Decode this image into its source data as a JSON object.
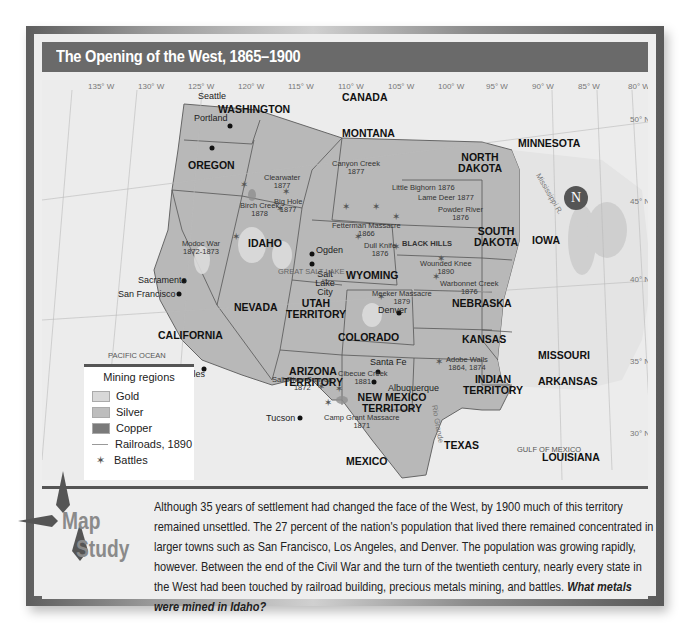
{
  "header": {
    "title": "The Opening of the West, 1865–1900"
  },
  "map": {
    "longitudes": [
      "135° W",
      "130° W",
      "125° W",
      "120° W",
      "115° W",
      "110° W",
      "105° W",
      "100° W",
      "95° W",
      "90° W",
      "85° W",
      "80° W"
    ],
    "latitudes": [
      "50° N",
      "45° N",
      "40° N",
      "35° N",
      "30° N"
    ],
    "regions": [
      "CANADA",
      "MEXICO",
      "PACIFIC OCEAN",
      "GULF OF MEXICO"
    ],
    "states": [
      "WASHINGTON",
      "OREGON",
      "CALIFORNIA",
      "NEVADA",
      "IDAHO",
      "MONTANA",
      "WYOMING",
      "UTAH TERRITORY",
      "COLORADO",
      "ARIZONA TERRITORY",
      "NEW MEXICO TERRITORY",
      "NORTH DAKOTA",
      "SOUTH DAKOTA",
      "NEBRASKA",
      "KANSAS",
      "INDIAN TERRITORY",
      "TEXAS",
      "MINNESOTA",
      "IOWA",
      "MISSOURI",
      "ARKANSAS",
      "LOUISIANA"
    ],
    "cities": [
      "Seattle",
      "Portland",
      "Sacramento",
      "San Francisco",
      "Los Angeles",
      "Tucson",
      "Ogden",
      "Salt Lake City",
      "Denver",
      "Santa Fe",
      "Albuquerque"
    ],
    "features": [
      "CASCADE RANGE",
      "ROCKY MOUNTAINS",
      "SIERRA NEVADA",
      "GREAT SALT LAKE",
      "BLACK HILLS",
      "Rio Grande",
      "Mississippi R."
    ],
    "battles": [
      {
        "name": "Clearwater",
        "year": "1877"
      },
      {
        "name": "Birch Creek",
        "year": "1878"
      },
      {
        "name": "Big Hole",
        "year": "1877"
      },
      {
        "name": "Canyon Creek",
        "year": "1877"
      },
      {
        "name": "Little Bighorn",
        "year": "1876"
      },
      {
        "name": "Lame Deer",
        "year": "1877"
      },
      {
        "name": "Powder River",
        "year": "1876"
      },
      {
        "name": "Fetterman Massacre",
        "year": "1866"
      },
      {
        "name": "Dull Knife",
        "year": "1876"
      },
      {
        "name": "Wounded Knee",
        "year": "1890"
      },
      {
        "name": "Warbonnet Creek",
        "year": "1876"
      },
      {
        "name": "Modoc War",
        "year": "1872-1873"
      },
      {
        "name": "Meeker Massacre",
        "year": "1879"
      },
      {
        "name": "Adobe Walls",
        "year": "1864, 1874"
      },
      {
        "name": "Salt River Canyon",
        "year": "1872"
      },
      {
        "name": "Cibecue Creek",
        "year": "1881"
      },
      {
        "name": "Camp Grant Massacre",
        "year": "1871"
      }
    ],
    "compass": "N"
  },
  "legend": {
    "title": "Mining regions",
    "items": [
      {
        "label": "Gold",
        "color": "#d8d8d8"
      },
      {
        "label": "Silver",
        "color": "#bdbdbd"
      },
      {
        "label": "Copper",
        "color": "#7a7a7a"
      },
      {
        "label": "Railroads, 1890"
      },
      {
        "label": "Battles"
      }
    ],
    "scale_miles": [
      "0",
      "200",
      "400 miles"
    ],
    "scale_km": [
      "0",
      "200",
      "400 kilometers"
    ]
  },
  "study": {
    "badge_word1": "Map",
    "badge_word2": "Study",
    "text": "Although 35 years of settlement had changed the face of the West, by 1900 much of this territory remained unsettled. The 27 percent of the nation's population that lived there remained concentrated in larger towns such as San Francisco, Los Angeles, and Denver. The population was growing rapidly, however. Between the end of the Civil War and the turn of the twentieth century, nearly every state in the West had been touched by railroad building, precious metals mining, and battles.",
    "question": "What metals were mined in Idaho?"
  }
}
